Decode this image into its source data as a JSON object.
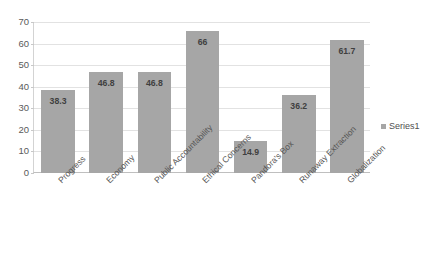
{
  "chart_data": {
    "type": "bar",
    "title": "",
    "subtitle": "",
    "xlabel": "",
    "ylabel": "",
    "ylim": [
      0,
      70
    ],
    "y_ticks": [
      0,
      10,
      20,
      30,
      40,
      50,
      60,
      70
    ],
    "grid": true,
    "grid_axis": "y",
    "legend_position": "right",
    "categories": [
      "Progress",
      "Economy",
      "Public Accountability",
      "Ethical Concerns",
      "Pandora's Box",
      "Runaway Extraction",
      "Globalization"
    ],
    "series": [
      {
        "name": "Series1",
        "color": "#a6a6a6",
        "values": [
          38.3,
          46.8,
          46.8,
          66,
          14.9,
          36.2,
          61.7
        ],
        "data_labels": [
          "38.3",
          "46.8",
          "46.8",
          "66",
          "14.9",
          "36.2",
          "61.7"
        ]
      }
    ]
  },
  "axes": {
    "y_tick_labels": [
      "70",
      "60",
      "50",
      "40",
      "30",
      "20",
      "10",
      "0"
    ]
  },
  "legend": {
    "entries": [
      {
        "label": "Series1",
        "swatch_icon": "legend-square-icon"
      }
    ]
  },
  "colors": {
    "bar_fill": "#a6a6a6",
    "gridline": "#e2e2e2",
    "axis_line": "#bfbfbf",
    "text": "#595959",
    "background": "#ffffff"
  }
}
